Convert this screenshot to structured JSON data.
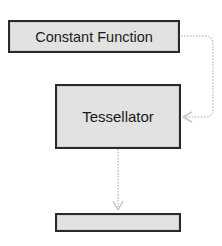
{
  "diagram": {
    "nodes": [
      {
        "id": "constant-function",
        "label": "Constant Function"
      },
      {
        "id": "tessellator",
        "label": "Tessellator"
      },
      {
        "id": "output",
        "label": ""
      }
    ],
    "edges": [
      {
        "from": "constant-function",
        "to": "tessellator",
        "style": "dotted",
        "color": "#c8c8c8"
      },
      {
        "from": "tessellator",
        "to": "output",
        "style": "dotted",
        "color": "#c8c8c8"
      }
    ],
    "colors": {
      "node_fill": "#e2e2e2",
      "node_border": "#2a2a2a",
      "edge": "#c8c8c8"
    }
  }
}
